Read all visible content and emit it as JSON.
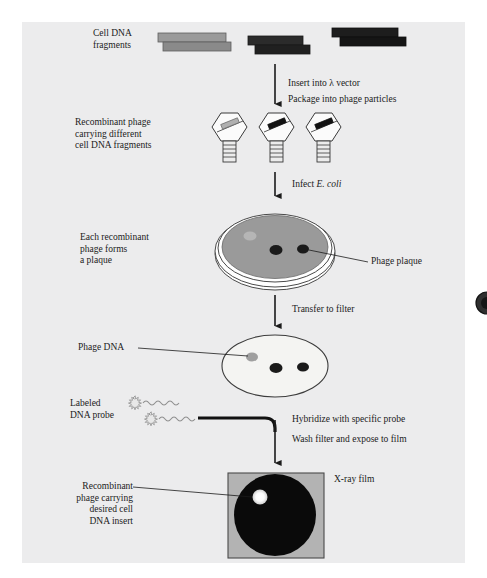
{
  "figure": {
    "background_color": "#ffffff",
    "panel_color": "#ececed"
  },
  "palette": {
    "panel": "#ececed",
    "fragment_light": "#8f8f8f",
    "fragment_mid": "#6e6e6e",
    "fragment_dark": "#2b2b2b",
    "fragment_black": "#151515",
    "dish_agar": "#9a9a9a",
    "dish_rim": "#ffffff",
    "plaque_dark": "#1a1a1a",
    "plaque_light": "#b5b5b5",
    "filter_fill": "#f4f4f2",
    "film_border": "#9d9d9d",
    "film_black": "#0a0a0a",
    "spot_white": "#ffffff",
    "probe_fill": "#e3e3e3",
    "probe_stroke": "#9a9a9a",
    "line": "#1b1b1b",
    "text": "#1b1b1b"
  },
  "labels": {
    "cell_dna_fragments": "Cell DNA\nfragments",
    "insert_into_vector": "Insert into λ vector",
    "package_into_phage": "Package into phage particles",
    "recombinant_phage": "Recombinant phage\ncarrying different\ncell DNA fragments",
    "infect_ecoli_prefix": "Infect ",
    "infect_ecoli_italic": "E. coli",
    "each_recombinant_plaque": "Each recombinant\nphage forms\na plaque",
    "phage_plaque": "Phage plaque",
    "transfer_to_filter": "Transfer to filter",
    "phage_dna": "Phage DNA",
    "labeled_dna_probe": "Labeled\nDNA probe",
    "hybridize_with_probe": "Hybridize with specific probe",
    "wash_and_expose": "Wash filter and expose to film",
    "xray_film": "X-ray film",
    "recombinant_desired": "Recombinant\nphage carrying\ndesired cell\nDNA insert"
  },
  "diagram": {
    "dna_fragments": [
      {
        "name": "fragment-group-1",
        "shade": "#8f8f8f",
        "bars": 2
      },
      {
        "name": "fragment-group-2",
        "shade": "#2b2b2b",
        "bars": 2
      },
      {
        "name": "fragment-group-3",
        "shade": "#151515",
        "bars": 2
      }
    ],
    "phage_particles": [
      {
        "name": "phage-1",
        "insert_shade": "#b0b0b0"
      },
      {
        "name": "phage-2",
        "insert_shade": "#121212"
      },
      {
        "name": "phage-3",
        "insert_shade": "#121212"
      }
    ],
    "petri_dish": {
      "plaques": [
        {
          "name": "plaque-light",
          "shade": "#b5b5b5"
        },
        {
          "name": "plaque-dark-1",
          "shade": "#1a1a1a"
        },
        {
          "name": "plaque-dark-2",
          "shade": "#1a1a1a"
        }
      ]
    },
    "filter": {
      "spots": [
        {
          "name": "spot-light",
          "shade": "#9f9f9f"
        },
        {
          "name": "spot-dark-1",
          "shade": "#1a1a1a"
        },
        {
          "name": "spot-dark-2",
          "shade": "#1a1a1a"
        }
      ]
    },
    "probes": 2,
    "xray_film": {
      "signal_spots": 1
    }
  }
}
